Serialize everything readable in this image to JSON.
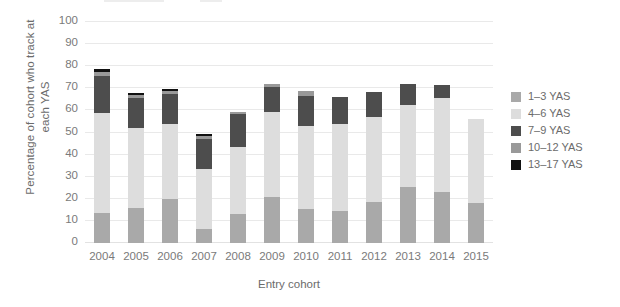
{
  "chart_data": {
    "type": "bar",
    "subtype": "stacked-vertical",
    "title": "",
    "xlabel": "Entry cohort",
    "ylabel": "Percentage of cohort who track at each YAS",
    "ylim": [
      0,
      100
    ],
    "yticks": [
      0,
      10,
      20,
      30,
      40,
      50,
      60,
      70,
      80,
      90,
      100
    ],
    "grid": true,
    "legend_position": "right",
    "categories": [
      "2004",
      "2005",
      "2006",
      "2007",
      "2008",
      "2009",
      "2010",
      "2011",
      "2012",
      "2013",
      "2014",
      "2015"
    ],
    "series": [
      {
        "name": "1–3 YAS",
        "color": "#a9a9a9",
        "values": [
          13.5,
          16,
          20,
          6.5,
          13,
          21,
          15.5,
          14.5,
          18.5,
          25.5,
          23,
          18
        ]
      },
      {
        "name": "4–6 YAS",
        "color": "#dddddd",
        "values": [
          45.5,
          36,
          34,
          27,
          30.5,
          38.5,
          37.5,
          39.5,
          38.5,
          37,
          42.5,
          38
        ]
      },
      {
        "name": "7–9 YAS",
        "color": "#4d4d4d",
        "values": [
          16.5,
          13.5,
          13.5,
          13.5,
          15,
          11,
          13.5,
          12,
          11.5,
          9.5,
          6,
          0
        ]
      },
      {
        "name": "10–12 YAS",
        "color": "#999999",
        "values": [
          2,
          1.5,
          1.5,
          1.5,
          0.8,
          1.5,
          2.5,
          0,
          0,
          0,
          0,
          0
        ]
      },
      {
        "name": "13–17 YAS",
        "color": "#111111",
        "values": [
          1.2,
          0.8,
          0.9,
          1,
          0,
          0,
          0,
          0,
          0,
          0,
          0,
          0
        ]
      }
    ],
    "totals": [
      78.7,
      67.8,
      69.9,
      49.5,
      59.3,
      72,
      69,
      66,
      68.5,
      72,
      71.5,
      56
    ]
  },
  "axes": {
    "y_title_line1": "Percentage of cohort who track at",
    "y_title_line2": "each YAS",
    "x_title": "Entry cohort"
  },
  "legend": {
    "items": [
      {
        "label": "1–3 YAS",
        "color": "#a9a9a9"
      },
      {
        "label": "4–6 YAS",
        "color": "#dddddd"
      },
      {
        "label": "7–9 YAS",
        "color": "#4d4d4d"
      },
      {
        "label": "10–12 YAS",
        "color": "#999999"
      },
      {
        "label": "13–17 YAS",
        "color": "#111111"
      }
    ]
  }
}
